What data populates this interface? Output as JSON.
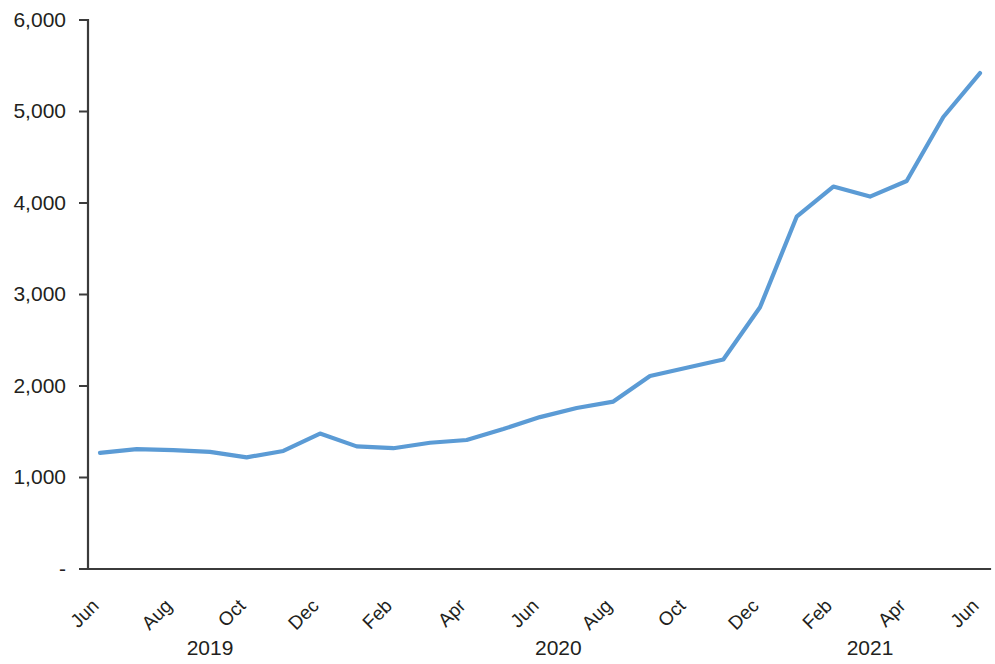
{
  "chart_data": {
    "type": "line",
    "title": "",
    "subtitle": "",
    "xlabel": "",
    "ylabel": "",
    "grid": false,
    "legend": false,
    "legend_position": "none",
    "line_color": "#5b9bd5",
    "axis_color": "#3b3b3b",
    "text_color": "#231f20",
    "ylim": [
      0,
      6000
    ],
    "ytick_values": [
      0,
      1000,
      2000,
      3000,
      4000,
      5000,
      6000
    ],
    "ytick_labels": [
      "-",
      "1,000",
      "2,000",
      "3,000",
      "4,000",
      "5,000",
      "6,000"
    ],
    "x": [
      "Jun 2019",
      "Jul 2019",
      "Aug 2019",
      "Sep 2019",
      "Oct 2019",
      "Nov 2019",
      "Dec 2019",
      "Jan 2020",
      "Feb 2020",
      "Mar 2020",
      "Apr 2020",
      "May 2020",
      "Jun 2020",
      "Jul 2020",
      "Aug 2020",
      "Sep 2020",
      "Oct 2020",
      "Nov 2020",
      "Dec 2020",
      "Jan 2021",
      "Feb 2021",
      "Mar 2021",
      "Apr 2021",
      "May 2021",
      "Jun 2021"
    ],
    "xtick_labels": [
      "Jun",
      "",
      "Aug",
      "",
      "Oct",
      "",
      "Dec",
      "",
      "Feb",
      "",
      "Apr",
      "",
      "Jun",
      "",
      "Aug",
      "",
      "Oct",
      "",
      "Dec",
      "",
      "Feb",
      "",
      "Apr",
      "",
      "Jun"
    ],
    "xtick_visible_labels": [
      "Jun",
      "Aug",
      "Oct",
      "Dec",
      "Feb",
      "Apr",
      "Jun",
      "Aug",
      "Oct",
      "Dec",
      "Feb",
      "Apr",
      "Jun"
    ],
    "year_groups": [
      {
        "label": "2019",
        "center_index": 3
      },
      {
        "label": "2020",
        "center_index": 12.5
      },
      {
        "label": "2021",
        "center_index": 21
      }
    ],
    "values": [
      1270,
      1310,
      1300,
      1280,
      1220,
      1290,
      1480,
      1340,
      1320,
      1380,
      1410,
      1530,
      1660,
      1760,
      1830,
      2110,
      2200,
      2290,
      2860,
      3850,
      4180,
      4070,
      4240,
      4940,
      5420
    ],
    "series": [
      {
        "name": "Series 1",
        "color": "#5b9bd5",
        "values": [
          1270,
          1310,
          1300,
          1280,
          1220,
          1290,
          1480,
          1340,
          1320,
          1380,
          1410,
          1530,
          1660,
          1760,
          1830,
          2110,
          2200,
          2290,
          2860,
          3850,
          4180,
          4070,
          4240,
          4940,
          5420
        ]
      }
    ]
  }
}
